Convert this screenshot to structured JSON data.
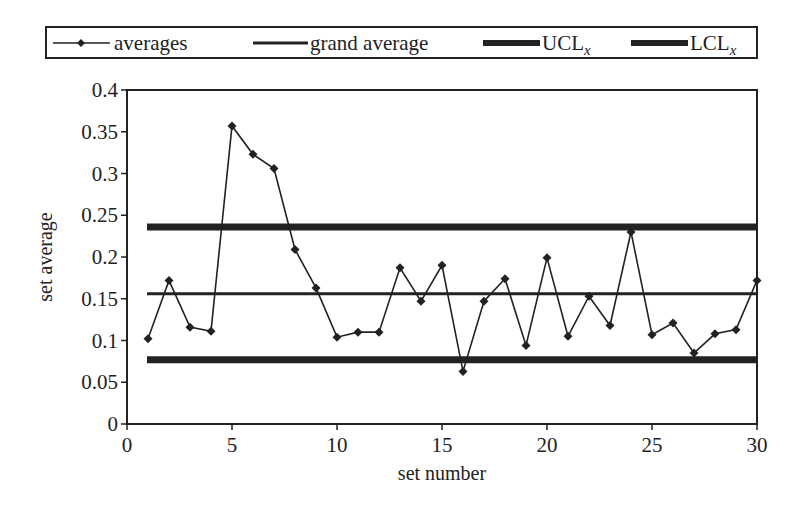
{
  "chart_data": {
    "type": "line",
    "title": "",
    "xlabel": "set number",
    "ylabel": "set average",
    "xlim": [
      0,
      30
    ],
    "ylim": [
      0,
      0.4
    ],
    "x_ticks": [
      0,
      5,
      10,
      15,
      20,
      25,
      30
    ],
    "x_tick_labels": [
      "0",
      "5",
      "10",
      "15",
      "20",
      "25",
      "30"
    ],
    "y_ticks": [
      0,
      0.05,
      0.1,
      0.15,
      0.2,
      0.25,
      0.3,
      0.35,
      0.4
    ],
    "y_tick_labels": [
      "0",
      "0.05",
      "0.1",
      "0.15",
      "0.2",
      "0.25",
      "0.3",
      "0.35",
      "0.4"
    ],
    "grid": false,
    "legend_position": "top",
    "x": [
      1,
      2,
      3,
      4,
      5,
      6,
      7,
      8,
      9,
      10,
      11,
      12,
      13,
      14,
      15,
      16,
      17,
      18,
      19,
      20,
      21,
      22,
      23,
      24,
      25,
      26,
      27,
      28,
      29,
      30
    ],
    "series": [
      {
        "name": "averages",
        "style": "line-with-diamond-markers",
        "values": [
          0.102,
          0.172,
          0.116,
          0.111,
          0.357,
          0.323,
          0.306,
          0.209,
          0.163,
          0.104,
          0.11,
          0.11,
          0.187,
          0.147,
          0.19,
          0.063,
          0.147,
          0.174,
          0.094,
          0.199,
          0.105,
          0.153,
          0.118,
          0.23,
          0.107,
          0.121,
          0.085,
          0.108,
          0.113,
          0.172
        ]
      },
      {
        "name": "grand average",
        "style": "thin-horizontal-line",
        "value": 0.156,
        "x_range": [
          1,
          30
        ]
      },
      {
        "name": "UCL",
        "subscript": "x",
        "style": "thick-horizontal-line",
        "value": 0.236,
        "x_range": [
          1,
          30
        ]
      },
      {
        "name": "LCL",
        "subscript": "x",
        "style": "thick-horizontal-line",
        "value": 0.077,
        "x_range": [
          1,
          30
        ]
      }
    ]
  },
  "legend": {
    "items": [
      {
        "label": "averages",
        "sub": ""
      },
      {
        "label": "grand average",
        "sub": ""
      },
      {
        "label": "UCL",
        "sub": "x"
      },
      {
        "label": "LCL",
        "sub": "x"
      }
    ]
  },
  "colors": {
    "ink": "#222222",
    "background": "#ffffff"
  }
}
